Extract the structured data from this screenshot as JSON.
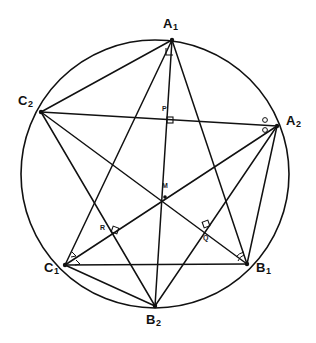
{
  "figure": {
    "background_color": "#ffffff",
    "stroke_color": "#111111",
    "circle": {
      "cx": 155,
      "cy": 174,
      "r": 134
    }
  },
  "vertices": [
    {
      "id": "A1",
      "label": "A",
      "sub": "1",
      "x": 172,
      "y": 40,
      "label_x": 163,
      "label_y": 17
    },
    {
      "id": "A2",
      "label": "A",
      "sub": "2",
      "x": 277,
      "y": 126,
      "label_x": 286,
      "label_y": 114
    },
    {
      "id": "B1",
      "label": "B",
      "sub": "1",
      "x": 247,
      "y": 264,
      "label_x": 256,
      "label_y": 261
    },
    {
      "id": "B2",
      "label": "B",
      "sub": "2",
      "x": 155,
      "y": 306,
      "label_x": 146,
      "label_y": 313
    },
    {
      "id": "C1",
      "label": "C",
      "sub": "1",
      "x": 65,
      "y": 265,
      "label_x": 44,
      "label_y": 261
    },
    {
      "id": "C2",
      "label": "C",
      "sub": "2",
      "x": 41,
      "y": 112,
      "label_x": 18,
      "label_y": 94
    }
  ],
  "interior_points": [
    {
      "id": "P",
      "label": "P",
      "x": 170,
      "y": 120,
      "label_x": 162,
      "label_y": 105
    },
    {
      "id": "M",
      "label": "M",
      "x": 165,
      "y": 197,
      "label_x": 162,
      "label_y": 182
    },
    {
      "id": "Q",
      "label": "Q",
      "x": 206,
      "y": 227,
      "label_x": 203,
      "label_y": 234
    },
    {
      "id": "R",
      "label": "R",
      "x": 114,
      "y": 230,
      "label_x": 100,
      "label_y": 224
    }
  ],
  "segments": [
    {
      "from": "A1",
      "to": "B1"
    },
    {
      "from": "A1",
      "to": "B2"
    },
    {
      "from": "A1",
      "to": "C1"
    },
    {
      "from": "A1",
      "to": "C2"
    },
    {
      "from": "A2",
      "to": "B2"
    },
    {
      "from": "A2",
      "to": "C1"
    },
    {
      "from": "A2",
      "to": "C2"
    },
    {
      "from": "A2",
      "to": "B1"
    },
    {
      "from": "B1",
      "to": "C1"
    },
    {
      "from": "B1",
      "to": "C2"
    },
    {
      "from": "B2",
      "to": "C1"
    },
    {
      "from": "B2",
      "to": "C2"
    }
  ],
  "right_angle_marks": [
    {
      "at": "P",
      "size": 6
    },
    {
      "at": "Q",
      "size": 6
    },
    {
      "at": "R",
      "size": 6
    },
    {
      "at": "A1",
      "size": 7
    }
  ],
  "angle_arcs": [
    {
      "at": "A2",
      "count": 2
    },
    {
      "at": "B1",
      "count": 2
    },
    {
      "at": "C1",
      "count": 2
    }
  ]
}
